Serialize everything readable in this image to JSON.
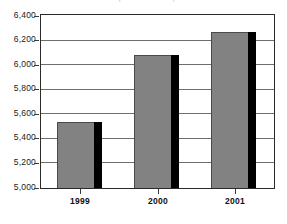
{
  "chart_data": {
    "type": "bar",
    "title": "",
    "title_remnant": "(in thousands)",
    "xlabel": "",
    "ylabel": "",
    "categories": [
      "1999",
      "2000",
      "2001"
    ],
    "values": [
      5535,
      6080,
      6270
    ],
    "series": [
      {
        "name": "Value",
        "values": [
          5535,
          6080,
          6270
        ]
      }
    ],
    "ylim": [
      5000,
      6400
    ],
    "ytick_step": 200,
    "ytick_labels": [
      "6,400",
      "6,200",
      "6,000",
      "5,800",
      "5,600",
      "5,400",
      "5,200",
      "5,000"
    ],
    "ytick_values": [
      6400,
      6200,
      6000,
      5800,
      5600,
      5400,
      5200,
      5000
    ],
    "grid": true,
    "legend": false,
    "legend_position": "none",
    "bar_style": "3d-shadow",
    "colors": {
      "bar_fill": "#828282",
      "bar_outline": "#4a4a4a",
      "bar_shadow": "#000000",
      "gridline": "#6e6e6e",
      "frame": "#2b2b2b",
      "text": "#111111",
      "background": "#ffffff"
    }
  }
}
